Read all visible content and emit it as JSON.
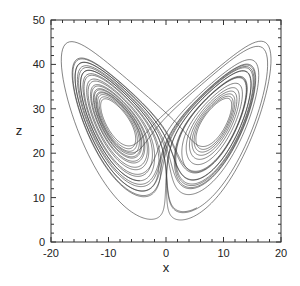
{
  "chart_data": {
    "type": "line",
    "title": "",
    "xlabel": "x",
    "ylabel": "z",
    "xlim": [
      -20,
      20
    ],
    "ylim": [
      0,
      50
    ],
    "xticks": [
      -20,
      -10,
      0,
      10,
      20
    ],
    "yticks": [
      0,
      10,
      20,
      30,
      40,
      50
    ],
    "minor_tick_step": 2,
    "grid": false,
    "legend": null,
    "series": [
      {
        "name": "trajectory",
        "system": "lorenz",
        "parameters": {
          "sigma": 10,
          "rho": 28,
          "beta": 2.6667
        },
        "initial_state": [
          1.0,
          1.0,
          20.0
        ],
        "dt": 0.005,
        "steps": 6000,
        "transient_steps": 200,
        "color": "#333333"
      }
    ],
    "observed_features": {
      "left_lobe_center_approx": [
        -8,
        27
      ],
      "right_lobe_center_approx": [
        8.5,
        27
      ],
      "z_range_approx": [
        8,
        47
      ],
      "x_range_approx": [
        -18,
        18
      ]
    }
  },
  "axes": {
    "x_label": "x",
    "y_label": "z",
    "x_tick_labels": [
      "-20",
      "-10",
      "0",
      "10",
      "20"
    ],
    "y_tick_labels": [
      "0",
      "10",
      "20",
      "30",
      "40",
      "50"
    ]
  }
}
